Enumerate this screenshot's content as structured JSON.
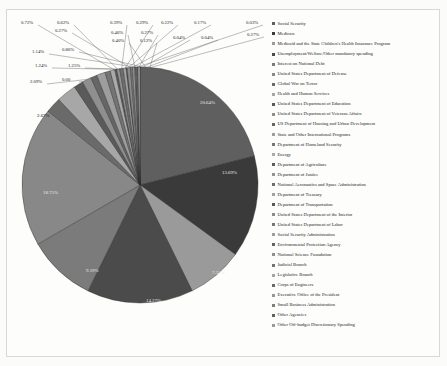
{
  "chart_data": {
    "type": "pie",
    "title": "",
    "legend_position": "right",
    "labels_show_percent": true,
    "categories": [
      "Social Security",
      "Medicare",
      "Medicaid and the State Children's Health Insurance Program",
      "Unemployment/Welfare/Other mandatory spending",
      "Interest on National Debt",
      "United States Department of Defense",
      "Global War on Terror",
      "Health and Human Services",
      "United States Department of Education",
      "United States Department of Veterans Affairs",
      "US Department of Housing and Urban Development",
      "State and Other International Programs",
      "Department of Homeland Security",
      "Energy",
      "Department of Agriculture",
      "Department of Justice",
      "National Aeronautics and Space Administration",
      "Department of Treasury",
      "Department of Transportation",
      "United States Department of the Interior",
      "United States Department of Labor",
      "Social Security Administration",
      "Environmental Protection Agency",
      "National Science Foundation",
      "Judicial Branch",
      "Legislative Branch",
      "Corps of Engineers",
      "Executive Office of the President",
      "Small Business Administration",
      "Other Agencies",
      "Other Off-budget Discretionary Spending"
    ],
    "values": [
      20.64,
      13.69,
      7.55,
      14.27,
      9.19,
      18.75,
      2.09,
      2.67,
      1.25,
      1.24,
      0.86,
      1.14,
      0.72,
      0.62,
      0.27,
      0.39,
      0.46,
      0.4,
      0.12,
      0.44,
      0.29,
      0.29,
      0.22,
      0.17,
      0.04,
      0.27,
      0.0,
      0.0,
      0.0,
      0.0,
      0.0
    ],
    "value_labels": [
      "20.64%",
      "13.69%",
      "7.55%",
      "14.27%",
      "9.19%",
      "18.75%",
      "2.09%",
      "2.67%",
      "1.25%",
      "1.24%",
      "0.86%",
      "1.14%",
      "0.72%",
      "0.62%",
      "0.27%",
      "0.39%",
      "0.46%",
      "0.40%",
      "0.12%",
      "0.44%",
      "0.29%",
      "0.29%",
      "0.22%",
      "0.17%",
      "0.04%",
      "0.27%",
      "0.00",
      "0.00",
      "0.00",
      "0.00",
      "0.00"
    ],
    "slice_colors": [
      "#5f5f5f",
      "#3a3a3a",
      "#9a9a9a",
      "#4b4b4b",
      "#7b7b7b",
      "#888888",
      "#6a6a6a",
      "#a7a7a7",
      "#5a5a5a",
      "#8f8f8f",
      "#666666",
      "#9e9e9e",
      "#747474",
      "#aaaaaa",
      "#5d5d5d",
      "#939393",
      "#6e6e6e",
      "#a2a2a2",
      "#585858",
      "#8b8b8b",
      "#777777",
      "#9c9c9c",
      "#636363",
      "#8e8e8e",
      "#727272",
      "#a5a5a5",
      "#696969",
      "#979797",
      "#7e7e7e",
      "#616161",
      "#999999"
    ],
    "callout_labels": [
      {
        "text": "0.72%",
        "x": 21,
        "y": 20
      },
      {
        "text": "0.62%",
        "x": 57,
        "y": 20
      },
      {
        "text": "0.39%",
        "x": 110,
        "y": 20
      },
      {
        "text": "0.29%",
        "x": 136,
        "y": 20
      },
      {
        "text": "0.22%",
        "x": 161,
        "y": 20
      },
      {
        "text": "0.17%",
        "x": 194,
        "y": 20
      },
      {
        "text": "0.03%",
        "x": 246,
        "y": 20
      },
      {
        "text": "0.27%",
        "x": 55,
        "y": 28
      },
      {
        "text": "0.46%",
        "x": 111,
        "y": 30
      },
      {
        "text": "0.27%",
        "x": 141,
        "y": 30
      },
      {
        "text": "0.04%",
        "x": 173,
        "y": 35
      },
      {
        "text": "0.04%",
        "x": 201,
        "y": 35
      },
      {
        "text": "0.27%",
        "x": 247,
        "y": 32
      },
      {
        "text": "0.40%",
        "x": 112,
        "y": 38
      },
      {
        "text": "0.12%",
        "x": 140,
        "y": 38
      },
      {
        "text": "1.14%",
        "x": 32,
        "y": 49
      },
      {
        "text": "0.86%",
        "x": 62,
        "y": 47
      },
      {
        "text": "1.24%",
        "x": 35,
        "y": 63
      },
      {
        "text": "1.25%",
        "x": 68,
        "y": 63
      },
      {
        "text": "2.09%",
        "x": 30,
        "y": 79
      },
      {
        "text": "0.00",
        "x": 62,
        "y": 77
      }
    ],
    "inner_labels": [
      {
        "text": "20.64%",
        "x": 200,
        "y": 100,
        "light": true
      },
      {
        "text": "2.67%",
        "x": 37,
        "y": 113,
        "light": false
      },
      {
        "text": "18.75%",
        "x": 43,
        "y": 190,
        "light": true
      },
      {
        "text": "13.69%",
        "x": 222,
        "y": 170,
        "light": true
      },
      {
        "text": "9.19%",
        "x": 86,
        "y": 268,
        "light": true
      },
      {
        "text": "14.27%",
        "x": 146,
        "y": 298,
        "light": true
      },
      {
        "text": "7.55%",
        "x": 212,
        "y": 270,
        "light": true
      }
    ]
  }
}
